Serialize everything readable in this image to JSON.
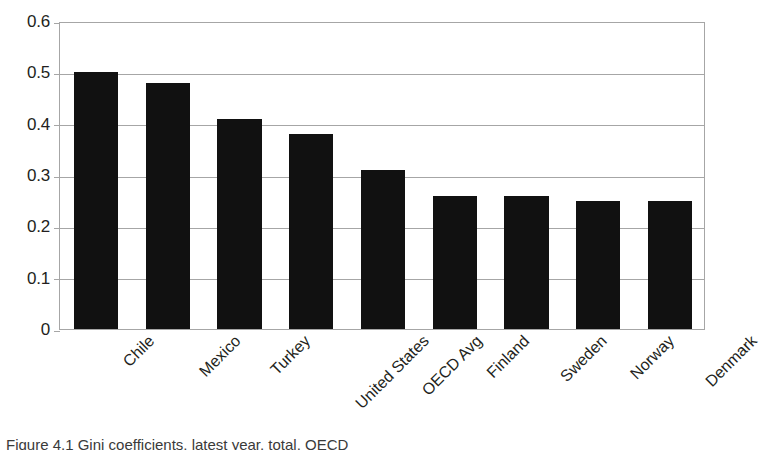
{
  "chart_data": {
    "type": "bar",
    "title": "",
    "xlabel": "",
    "ylabel": "",
    "ylim": [
      0,
      0.6
    ],
    "yticks": [
      "0",
      "0.1",
      "0.2",
      "0.3",
      "0.4",
      "0.5",
      "0.6"
    ],
    "ytick_values": [
      0,
      0.1,
      0.2,
      0.3,
      0.4,
      0.5,
      0.6
    ],
    "grid": "horizontal",
    "legend": "none",
    "bar_color": "#111111",
    "axis_color": "#a6a6a6",
    "categories": [
      "Chile",
      "Mexico",
      "Turkey",
      "United States",
      "OECD Avg",
      "Finland",
      "Sweden",
      "Norway",
      "Denmark"
    ],
    "values": [
      0.5,
      0.48,
      0.41,
      0.38,
      0.31,
      0.26,
      0.26,
      0.25,
      0.25
    ]
  },
  "caption": {
    "text": "Figure 4.1 Gini coefficients, latest year, total, OECD"
  }
}
